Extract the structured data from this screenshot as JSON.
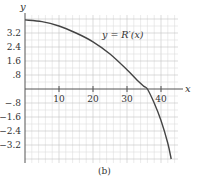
{
  "figure": {
    "caption": "(b)",
    "curve_label": "y = R′(x)",
    "x_axis_label": "x",
    "y_axis_label": "y"
  },
  "chart_data": {
    "type": "line",
    "title": "",
    "xlabel": "x",
    "ylabel": "y",
    "xlim": [
      0,
      45
    ],
    "ylim": [
      -4.2,
      4.3
    ],
    "x_ticks": [
      10,
      20,
      30,
      40
    ],
    "x_tick_labels": [
      "10",
      "20",
      "30",
      "40"
    ],
    "y_ticks": [
      3.2,
      2.4,
      1.6,
      0.8,
      -0.8,
      -1.6,
      -2.4,
      -3.2
    ],
    "y_tick_labels": [
      "3.2",
      "2.4",
      "1.6",
      ".8",
      "−.8",
      "−1.6",
      "−2.4",
      "−3.2"
    ],
    "grid": true,
    "legend": null,
    "annotations": [
      "y = R′(x)",
      "(b)"
    ],
    "series": [
      {
        "name": "R′(x)",
        "x": [
          0,
          5,
          10,
          15,
          20,
          25,
          30,
          33,
          35,
          36,
          38,
          40,
          42,
          43
        ],
        "y": [
          3.95,
          3.85,
          3.6,
          3.2,
          2.7,
          2.0,
          1.1,
          0.5,
          0.15,
          0.0,
          -0.8,
          -1.8,
          -3.1,
          -4.0
        ]
      }
    ]
  }
}
